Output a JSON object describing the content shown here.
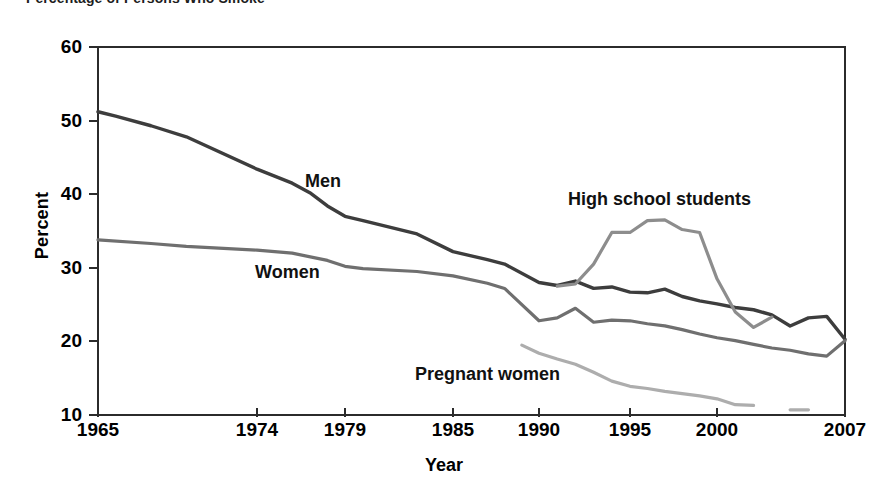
{
  "figure": {
    "title_clipped": "Percentage of Persons Who Smoke"
  },
  "chart_data": {
    "type": "line",
    "title": "",
    "xlabel": "Year",
    "ylabel": "Percent",
    "xlim": [
      1965,
      2007
    ],
    "ylim": [
      10,
      60
    ],
    "ytick_labels": [
      "60",
      "50",
      "40",
      "30",
      "20",
      "10"
    ],
    "ytick_values": [
      60,
      50,
      40,
      30,
      20,
      10
    ],
    "xtick_labels": [
      "1965",
      "1974",
      "1979",
      "1985",
      "1990",
      "1995",
      "2000",
      "2007"
    ],
    "xtick_values": [
      1965,
      1974,
      1979,
      1985,
      1990,
      1995,
      2000,
      2007
    ],
    "grid": false,
    "legend_position": "inline-annotations",
    "series": [
      {
        "name": "Men",
        "color": "#3d3d3d",
        "stroke_width": 3.4,
        "label_x": 305,
        "label_y": 172,
        "x": [
          1965,
          1966,
          1968,
          1970,
          1974,
          1976,
          1977,
          1978,
          1979,
          1980,
          1983,
          1985,
          1987,
          1988,
          1990,
          1991,
          1992,
          1993,
          1994,
          1995,
          1996,
          1997,
          1998,
          1999,
          2000,
          2001,
          2002,
          2003,
          2004,
          2005,
          2006,
          2007
        ],
        "y": [
          51.2,
          50.6,
          49.3,
          47.8,
          43.4,
          41.5,
          40.2,
          38.4,
          37.0,
          36.4,
          34.6,
          32.2,
          31.1,
          30.5,
          28.0,
          27.6,
          28.2,
          27.2,
          27.4,
          26.7,
          26.6,
          27.1,
          26.1,
          25.5,
          25.1,
          24.6,
          24.3,
          23.6,
          22.1,
          23.2,
          23.4,
          20.3
        ]
      },
      {
        "name": "Women",
        "color": "#6f6f6f",
        "stroke_width": 3.2,
        "label_x": 255,
        "label_y": 263,
        "x": [
          1965,
          1968,
          1970,
          1974,
          1976,
          1978,
          1979,
          1980,
          1983,
          1985,
          1987,
          1988,
          1990,
          1991,
          1992,
          1993,
          1994,
          1995,
          1996,
          1997,
          1998,
          1999,
          2000,
          2001,
          2002,
          2003,
          2004,
          2005,
          2006,
          2007
        ],
        "y": [
          33.8,
          33.3,
          32.9,
          32.4,
          32.0,
          31.0,
          30.2,
          29.9,
          29.5,
          28.9,
          27.9,
          27.2,
          22.8,
          23.2,
          24.5,
          22.6,
          22.9,
          22.8,
          22.4,
          22.1,
          21.6,
          21.0,
          20.5,
          20.1,
          19.6,
          19.1,
          18.8,
          18.3,
          18.0,
          20.1
        ]
      },
      {
        "name": "High school students",
        "color": "#8d8d8d",
        "stroke_width": 3.2,
        "label_x": 568,
        "label_y": 190,
        "x": [
          1991,
          1992,
          1993,
          1994,
          1995,
          1996,
          1997,
          1998,
          1999,
          2000,
          2001,
          2002,
          2003
        ],
        "y": [
          27.5,
          27.8,
          30.5,
          34.8,
          34.8,
          36.4,
          36.5,
          35.2,
          34.8,
          28.5,
          24.0,
          21.9,
          23.3
        ]
      },
      {
        "name": "Pregnant women",
        "color": "#adadad",
        "stroke_width": 3.2,
        "label_x": 415,
        "label_y": 365,
        "x": [
          1989,
          1990,
          1991,
          1992,
          1993,
          1994,
          1995,
          1996,
          1997,
          1998,
          1999,
          2000,
          2001,
          2002
        ],
        "y": [
          19.5,
          18.4,
          17.6,
          16.9,
          15.8,
          14.6,
          13.9,
          13.6,
          13.2,
          12.9,
          12.6,
          12.2,
          11.4,
          11.3
        ]
      },
      {
        "name": "Pregnant women (trailing segment)",
        "color": "#adadad",
        "stroke_width": 3.2,
        "label_x": null,
        "label_y": null,
        "x": [
          2004,
          2005
        ],
        "y": [
          10.7,
          10.7
        ]
      }
    ]
  }
}
